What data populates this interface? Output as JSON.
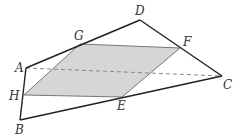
{
  "diagram": {
    "type": "geometry",
    "colors": {
      "edge": "#222222",
      "section_fill": "#d6d6d6",
      "section_edge": "#777777",
      "hidden_edge": "#888888",
      "label": "#333333"
    },
    "points": {
      "A": {
        "label": "A",
        "x": 26,
        "y": 68,
        "lx": 15,
        "ly": 72
      },
      "B": {
        "label": "B",
        "x": 20,
        "y": 120,
        "lx": 15,
        "ly": 134
      },
      "C": {
        "label": "C",
        "x": 222,
        "y": 76,
        "lx": 223,
        "ly": 89
      },
      "D": {
        "label": "D",
        "x": 140,
        "y": 20,
        "lx": 135,
        "ly": 15
      },
      "E": {
        "label": "E",
        "x": 122,
        "y": 97,
        "lx": 117,
        "ly": 110
      },
      "F": {
        "label": "F",
        "x": 180,
        "y": 48,
        "lx": 183,
        "ly": 46
      },
      "G": {
        "label": "G",
        "x": 80,
        "y": 44,
        "lx": 74,
        "ly": 40
      },
      "H": {
        "label": "H",
        "x": 24,
        "y": 95,
        "lx": 9,
        "ly": 100
      }
    },
    "edges_solid": [
      "AD",
      "DC",
      "CB",
      "BA"
    ],
    "edges_dashed": [
      "AC"
    ],
    "section": [
      "H",
      "G",
      "F",
      "E"
    ]
  }
}
